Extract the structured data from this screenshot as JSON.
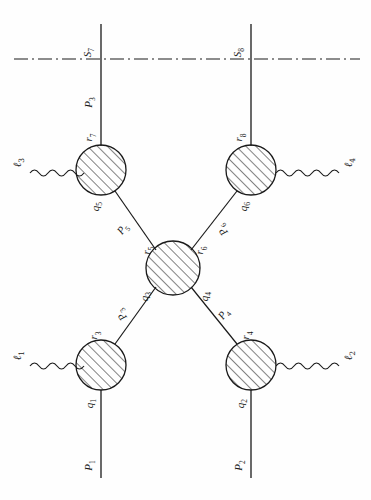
{
  "figure": {
    "type": "feynman-like-diagram",
    "orientation": "rotated-90-ccw",
    "stroke_color": "#1a1a1a",
    "background": "#fefefe",
    "blob_fill": "hatched"
  },
  "axis": {
    "name": "dash-dot-axis",
    "style": "dash-dot"
  },
  "blobs": [
    {
      "id": "blob-upper-left",
      "cx": 101,
      "cy": 170,
      "r": 25
    },
    {
      "id": "blob-upper-right",
      "cx": 251,
      "cy": 170,
      "r": 25
    },
    {
      "id": "blob-center",
      "cx": 173,
      "cy": 268,
      "r": 27
    },
    {
      "id": "blob-lower-left",
      "cx": 101,
      "cy": 365,
      "r": 25
    },
    {
      "id": "blob-lower-right",
      "cx": 251,
      "cy": 365,
      "r": 25
    }
  ],
  "labels": {
    "s7": "S",
    "s7_sub": "7",
    "s8": "S",
    "s8_sub": "8",
    "p3": "P",
    "p3_sub": "3",
    "p1": "P",
    "p1_sub": "1",
    "p2": "P",
    "p2_sub": "2",
    "p5": "P",
    "p5_sub": "5",
    "p6": "P",
    "p6_sub": "6",
    "p3d": "P",
    "p3d_sub": "3",
    "p4d": "P",
    "p4d_sub": "4",
    "r7": "r",
    "r7_sub": "7",
    "r8": "r",
    "r8_sub": "8",
    "r5": "r",
    "r5_sub": "5",
    "r6": "r",
    "r6_sub": "6",
    "r3": "r",
    "r3_sub": "3",
    "r4": "r",
    "r4_sub": "4",
    "q5": "q",
    "q5_sub": "5",
    "q6": "q",
    "q6_sub": "6",
    "q3": "q",
    "q3_sub": "3",
    "q4": "q",
    "q4_sub": "4",
    "q1": "q",
    "q1_sub": "1",
    "q2": "q",
    "q2_sub": "2",
    "l1": "ℓ",
    "l1_sub": "1",
    "l2": "ℓ",
    "l2_sub": "2",
    "l3": "ℓ",
    "l3_sub": "3",
    "l4": "ℓ",
    "l4_sub": "4"
  }
}
